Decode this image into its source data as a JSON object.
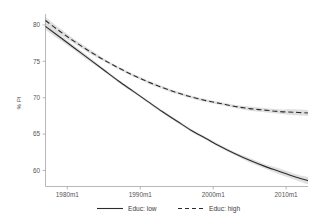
{
  "chart_data": {
    "type": "line",
    "title": "",
    "xlabel": "",
    "ylabel": "% PI",
    "xlim": [
      1977.0,
      2013.0
    ],
    "ylim": [
      57.8,
      81.5
    ],
    "grid": false,
    "legend_position": "bottom",
    "x_tick_labels": [
      "1980m1",
      "1990m1",
      "2000m1",
      "2010m1"
    ],
    "x_tick_values": [
      1980,
      1990,
      2000,
      2010
    ],
    "y_tick_labels": [
      "60",
      "65",
      "70",
      "75",
      "80"
    ],
    "y_tick_values": [
      60,
      65,
      70,
      75,
      80
    ],
    "x": [
      1977.0,
      1979.0,
      1981.0,
      1983.0,
      1985.0,
      1987.0,
      1989.0,
      1991.0,
      1993.0,
      1995.0,
      1997.0,
      1999.0,
      2001.0,
      2003.0,
      2005.0,
      2007.0,
      2009.0,
      2011.0,
      2013.0
    ],
    "series": [
      {
        "name": "Educ: low",
        "style": "solid",
        "color": "#2b2b2b",
        "values": [
          79.8,
          78.3,
          76.8,
          75.3,
          73.8,
          72.3,
          70.9,
          69.5,
          68.1,
          66.8,
          65.5,
          64.4,
          63.3,
          62.3,
          61.4,
          60.6,
          59.9,
          59.2,
          58.6
        ],
        "ci_low": [
          79.3,
          77.9,
          76.5,
          75.0,
          73.6,
          72.1,
          70.7,
          69.3,
          67.9,
          66.6,
          65.3,
          64.2,
          63.1,
          62.1,
          61.1,
          60.3,
          59.5,
          58.8,
          58.1
        ],
        "ci_high": [
          80.3,
          78.7,
          77.1,
          75.6,
          74.0,
          72.5,
          71.1,
          69.7,
          68.3,
          67.0,
          65.7,
          64.6,
          63.5,
          62.5,
          61.7,
          60.9,
          60.3,
          59.6,
          59.1
        ]
      },
      {
        "name": "Educ: high",
        "style": "dashed",
        "color": "#2b2b2b",
        "values": [
          80.6,
          79.1,
          77.7,
          76.4,
          75.2,
          74.1,
          73.1,
          72.2,
          71.4,
          70.7,
          70.1,
          69.6,
          69.2,
          68.8,
          68.5,
          68.3,
          68.1,
          68.0,
          67.9
        ],
        "ci_low": [
          80.1,
          78.7,
          77.4,
          76.1,
          75.0,
          73.9,
          72.9,
          72.0,
          71.2,
          70.5,
          69.9,
          69.4,
          69.0,
          68.6,
          68.2,
          68.0,
          67.8,
          67.6,
          67.5
        ],
        "ci_high": [
          81.1,
          79.5,
          78.0,
          76.7,
          75.4,
          74.3,
          73.3,
          72.4,
          71.6,
          70.9,
          70.3,
          69.8,
          69.4,
          69.0,
          68.8,
          68.6,
          68.4,
          68.4,
          68.3
        ]
      }
    ],
    "legend": [
      {
        "label": "Educ: low",
        "style": "solid"
      },
      {
        "label": "Educ: high",
        "style": "dashed"
      }
    ]
  }
}
